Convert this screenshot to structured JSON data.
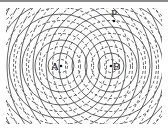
{
  "diagram": {
    "sources": [
      {
        "label": "A",
        "x": 61,
        "y": 66
      },
      {
        "label": "B",
        "x": 111,
        "y": 66
      }
    ],
    "point": {
      "label": "P",
      "x": 114,
      "y": 21
    },
    "legend": {
      "solid": "crest",
      "dashed": "trough"
    },
    "half_wavelength_px": 6.5,
    "colors": {
      "line": "#3a3a3a",
      "background": "#ffffff",
      "topbar": "#8a8a8a"
    }
  }
}
